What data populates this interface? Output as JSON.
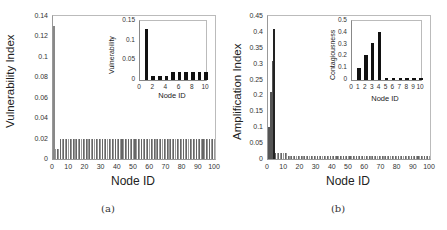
{
  "chart_data": [
    {
      "type": "bar",
      "panel": "(a)",
      "title": "",
      "xlabel": "Node ID",
      "ylabel": "Vulnerability Index",
      "xlim": [
        0,
        100
      ],
      "ylim": [
        0,
        0.14
      ],
      "xticks": [
        "0",
        "10",
        "20",
        "30",
        "40",
        "50",
        "60",
        "70",
        "80",
        "90",
        "100"
      ],
      "yticks": [
        "0",
        "0.02",
        "0.04",
        "0.06",
        "0.08",
        "0.1",
        "0.12",
        "0.14"
      ],
      "grid": false,
      "x": "1..100",
      "values_description": "node 1 = 0.13; nodes 2-4 = 0.01; nodes 5-100 = 0.02",
      "values_by_node": {
        "1": 0.13,
        "2": 0.01,
        "3": 0.01,
        "4": 0.01,
        "5-100": 0.02
      },
      "inset": {
        "type": "bar",
        "xlabel": "Node ID",
        "ylabel": "Vulnerability",
        "xlim": [
          0,
          10
        ],
        "ylim": [
          0,
          0.15
        ],
        "xticks": [
          "0",
          "2",
          "4",
          "6",
          "8",
          "10"
        ],
        "yticks": [
          "0",
          "0.05",
          "0.1",
          "0.15"
        ],
        "categories": [
          1,
          2,
          3,
          4,
          5,
          6,
          7,
          8,
          9,
          10
        ],
        "values": [
          0.13,
          0.01,
          0.01,
          0.01,
          0.02,
          0.02,
          0.02,
          0.02,
          0.02,
          0.02
        ]
      }
    },
    {
      "type": "bar",
      "panel": "(b)",
      "title": "",
      "xlabel": "Node ID",
      "ylabel": "Amplification Index",
      "xlim": [
        0,
        100
      ],
      "ylim": [
        0,
        0.45
      ],
      "xticks": [
        "0",
        "10",
        "20",
        "30",
        "40",
        "50",
        "60",
        "70",
        "80",
        "90",
        "100"
      ],
      "yticks": [
        "0",
        "0.05",
        "0.1",
        "0.15",
        "0.2",
        "0.25",
        "0.3",
        "0.35",
        "0.4",
        "0.45"
      ],
      "grid": false,
      "x": "1..100",
      "values_description": "node 1 = 0.1; node 2 = 0.21; node 3 = 0.31; node 4 = 0.41; nodes 5-12 = 0.02; nodes 13-100 = 0.01",
      "values_by_node": {
        "1": 0.1,
        "2": 0.21,
        "3": 0.31,
        "4": 0.41,
        "5-12": 0.02,
        "13-100": 0.01
      },
      "inset": {
        "type": "bar",
        "xlabel": "Node ID",
        "ylabel": "Contagiousness",
        "xlim": [
          0,
          10
        ],
        "ylim": [
          0,
          0.5
        ],
        "xticks": [
          "0",
          "1",
          "2",
          "3",
          "4",
          "5",
          "6",
          "7",
          "8",
          "9",
          "10"
        ],
        "yticks": [
          "0",
          "0.1",
          "0.2",
          "0.3",
          "0.4",
          "0.5"
        ],
        "categories": [
          1,
          2,
          3,
          4,
          5,
          6,
          7,
          8,
          9,
          10
        ],
        "values": [
          0.1,
          0.21,
          0.31,
          0.41,
          0.02,
          0.02,
          0.02,
          0.02,
          0.02,
          0.02
        ]
      }
    }
  ],
  "captions": {
    "a": "(a)",
    "b": "(b)"
  }
}
